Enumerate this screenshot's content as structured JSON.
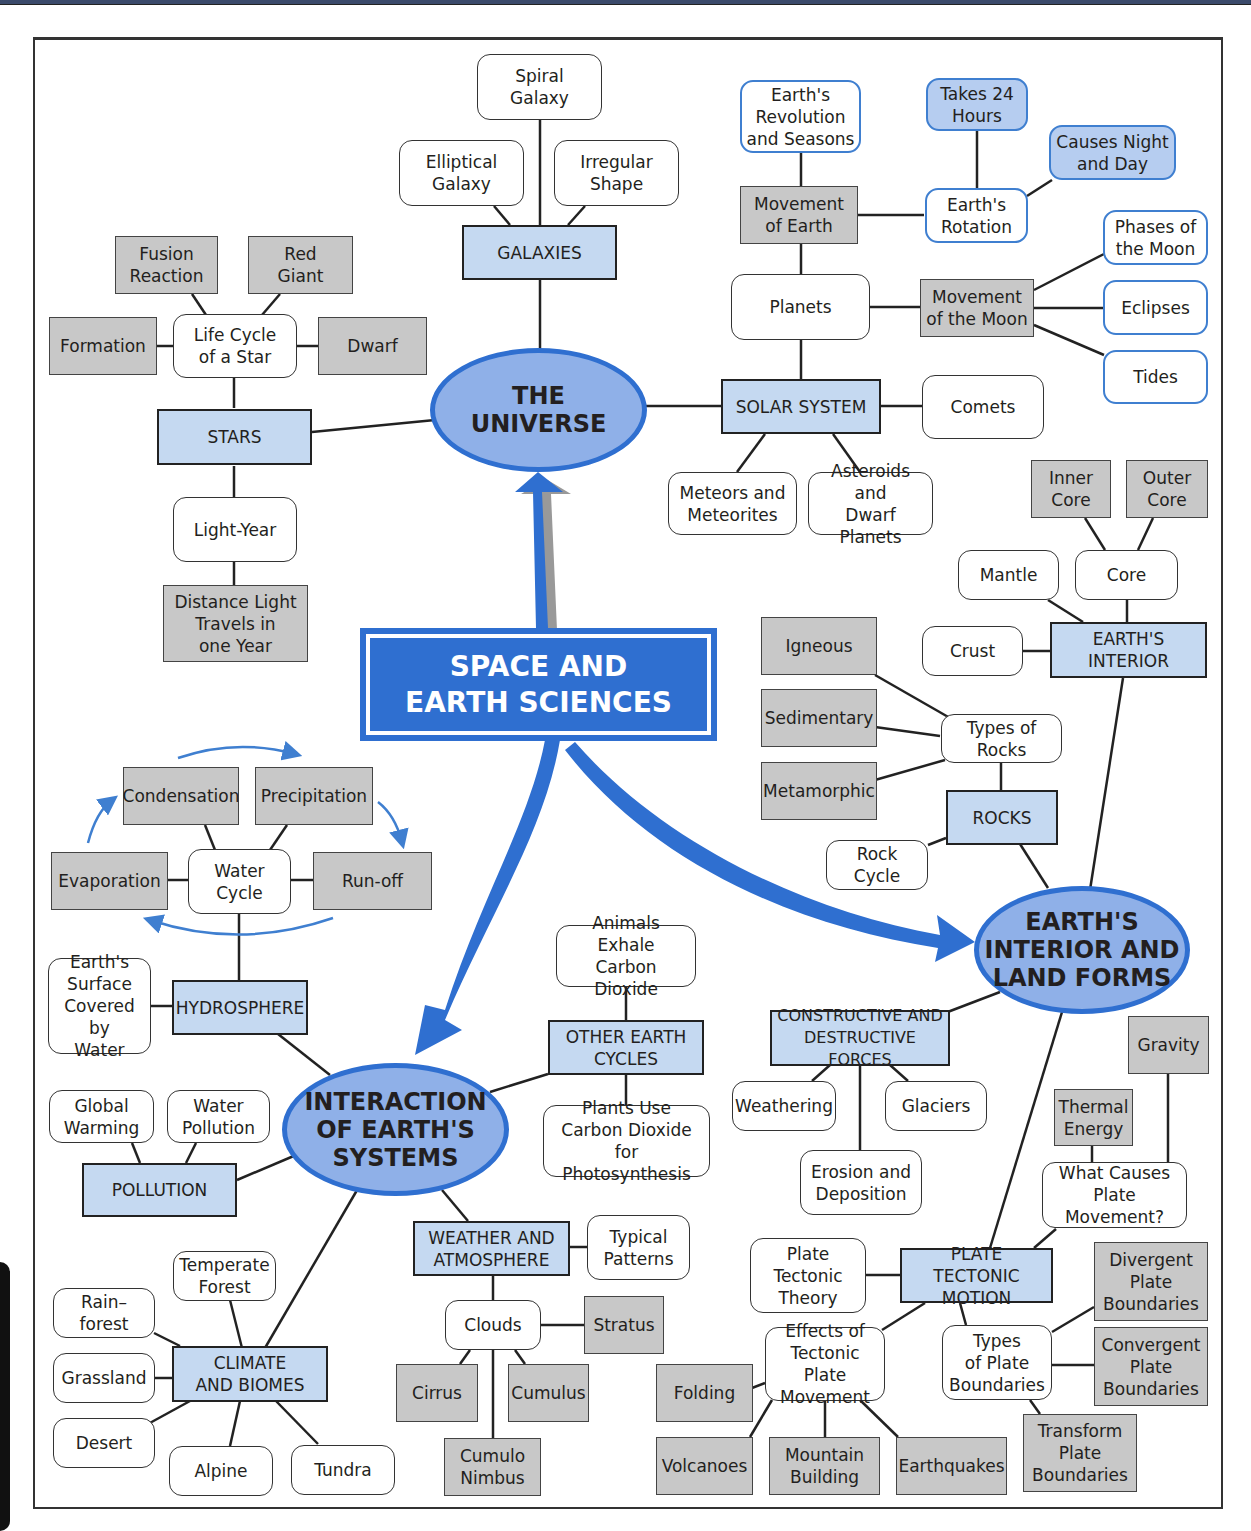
{
  "colors": {
    "central_fill": "#2f6fd0",
    "main_topic_fill": "#8fb0e8",
    "subtopic_fill": "#c5d9f1",
    "detail_gray": "#c8c8c8",
    "highlight_blue": "#b6cdf0",
    "arrow_blue": "#2f6fd0"
  },
  "central": {
    "label": "SPACE AND\nEARTH SCIENCES"
  },
  "main_topics": {
    "universe": "THE\nUNIVERSE",
    "interaction": "INTERACTION\nOF EARTH'S\nSYSTEMS",
    "earth_interior_land": "EARTH'S\nINTERIOR AND\nLAND FORMS"
  },
  "universe": {
    "galaxies": {
      "label": "GALAXIES",
      "children": [
        "Spiral\nGalaxy",
        "Elliptical\nGalaxy",
        "Irregular\nShape"
      ]
    },
    "stars": {
      "label": "STARS",
      "life_cycle": {
        "label": "Life Cycle\nof a Star",
        "children": [
          "Fusion\nReaction",
          "Red\nGiant",
          "Formation",
          "Dwarf"
        ]
      },
      "light_year": {
        "label": "Light-Year",
        "definition": "Distance Light\nTravels in\none Year"
      }
    },
    "solar_system": {
      "label": "SOLAR SYSTEM",
      "comets": "Comets",
      "meteors": "Meteors and\nMeteorites",
      "asteroids": "Asteroids and\nDwarf Planets",
      "planets": "Planets",
      "movement_of_earth": {
        "label": "Movement\nof Earth",
        "revolution": "Earth's\nRevolution\nand Seasons",
        "rotation": {
          "label": "Earth's\nRotation",
          "children": [
            "Takes 24\nHours",
            "Causes Night\nand Day"
          ]
        }
      },
      "movement_of_moon": {
        "label": "Movement\nof the Moon",
        "children": [
          "Phases of\nthe Moon",
          "Eclipses",
          "Tides"
        ]
      }
    }
  },
  "earth_interior_land": {
    "earths_interior": {
      "label": "EARTH'S\nINTERIOR",
      "crust": "Crust",
      "mantle": "Mantle",
      "core": {
        "label": "Core",
        "children": [
          "Inner\nCore",
          "Outer\nCore"
        ]
      }
    },
    "rocks": {
      "label": "ROCKS",
      "rock_cycle": "Rock Cycle",
      "types": {
        "label": "Types of Rocks",
        "children": [
          "Igneous",
          "Sedimentary",
          "Metamorphic"
        ]
      }
    },
    "forces": {
      "label": "CONSTRUCTIVE AND\nDESTRUCTIVE FORCES",
      "children": [
        "Weathering",
        "Glaciers",
        "Erosion and\nDeposition"
      ]
    },
    "plate_tectonic_motion": {
      "label": "PLATE TECTONIC\nMOTION",
      "theory": "Plate\nTectonic\nTheory",
      "causes": {
        "label": "What Causes\nPlate Movement?",
        "children": [
          "Thermal\nEnergy",
          "Gravity"
        ]
      },
      "effects": {
        "label": "Effects of\nTectonic Plate\nMovement",
        "children": [
          "Folding",
          "Volcanoes",
          "Mountain\nBuilding",
          "Earthquakes"
        ]
      },
      "boundaries": {
        "label": "Types\nof Plate\nBoundaries",
        "children": [
          "Divergent\nPlate\nBoundaries",
          "Convergent\nPlate\nBoundaries",
          "Transform\nPlate\nBoundaries"
        ]
      }
    }
  },
  "interaction": {
    "hydrosphere": {
      "label": "HYDROSPHERE",
      "surface": "Earth's\nSurface\nCovered by\nWater",
      "water_cycle": {
        "label": "Water\nCycle",
        "children": [
          "Condensation",
          "Precipitation",
          "Evaporation",
          "Run-off"
        ]
      }
    },
    "other_cycles": {
      "label": "OTHER EARTH\nCYCLES",
      "children": [
        "Animals Exhale\nCarbon Dioxide",
        "Plants Use\nCarbon Dioxide\nfor Photosynthesis"
      ]
    },
    "pollution": {
      "label": "POLLUTION",
      "children": [
        "Global\nWarming",
        "Water\nPollution"
      ]
    },
    "climate": {
      "label": "CLIMATE\nAND BIOMES",
      "children": [
        "Temperate\nForest",
        "Rain–\nforest",
        "Grassland",
        "Desert",
        "Alpine",
        "Tundra"
      ]
    },
    "weather": {
      "label": "WEATHER AND\nATMOSPHERE",
      "patterns": "Typical\nPatterns",
      "clouds": {
        "label": "Clouds",
        "children": [
          "Stratus",
          "Cirrus",
          "Cumulus",
          "Cumulo\nNimbus"
        ]
      }
    }
  }
}
